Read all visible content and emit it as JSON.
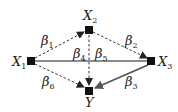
{
  "diagram": {
    "nodes": [
      {
        "id": "X1",
        "label": "X",
        "sub": "1",
        "x": 31,
        "y": 61
      },
      {
        "id": "X2",
        "label": "X",
        "sub": "2",
        "x": 89,
        "y": 30
      },
      {
        "id": "X3",
        "label": "X",
        "sub": "3",
        "x": 151,
        "y": 61
      },
      {
        "id": "Y",
        "label": "Y",
        "sub": "",
        "x": 89,
        "y": 91
      }
    ],
    "edges": [
      {
        "from": "X1",
        "to": "X2",
        "label": "β",
        "sub": "1",
        "style": "dashed"
      },
      {
        "from": "X2",
        "to": "X3",
        "label": "β",
        "sub": "2",
        "style": "dashed"
      },
      {
        "from": "X3",
        "to": "Y",
        "label": "β",
        "sub": "3",
        "style": "solid"
      },
      {
        "from": "X1",
        "to": "X3",
        "label": "β",
        "sub": "4",
        "style": "solid"
      },
      {
        "from": "X2",
        "to": "Y",
        "label": "β",
        "sub": "5",
        "style": "dashed"
      },
      {
        "from": "X1",
        "to": "Y",
        "label": "β",
        "sub": "6",
        "style": "dashed"
      }
    ],
    "colors": {
      "solid_edge": "#666666",
      "dashed_edge": "#333333",
      "node": "#111111"
    }
  }
}
